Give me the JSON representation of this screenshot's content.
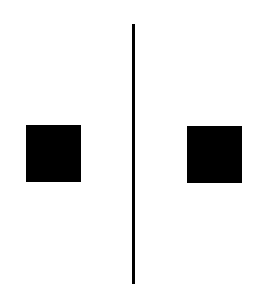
{
  "diagram": {
    "background": "#ffffff",
    "shapes": [
      {
        "id": "left-square",
        "type": "square",
        "color": "#000000",
        "x": 26,
        "y": 125,
        "width": 55,
        "height": 57
      },
      {
        "id": "vertical-line",
        "type": "line",
        "color": "#000000",
        "x": 132,
        "y": 24,
        "width": 3,
        "height": 260
      },
      {
        "id": "right-square",
        "type": "square",
        "color": "#000000",
        "x": 187,
        "y": 126,
        "width": 55,
        "height": 57
      }
    ]
  }
}
